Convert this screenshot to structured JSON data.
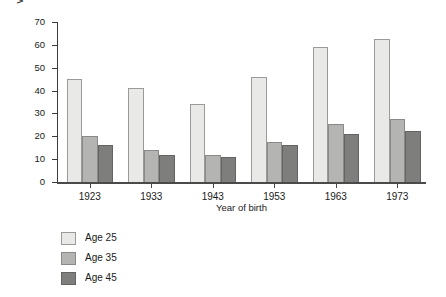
{
  "chart_data": {
    "type": "bar",
    "title": "",
    "subtitle": "",
    "xlabel": "Year of birth",
    "ylabel": "Women childless (%)",
    "categories": [
      "1923",
      "1933",
      "1943",
      "1953",
      "1963",
      "1973"
    ],
    "series": [
      {
        "name": "Age 25",
        "color": "#e9e9e7",
        "values": [
          45,
          41,
          34,
          46,
          59,
          62.5
        ]
      },
      {
        "name": "Age 35",
        "color": "#b4b4b2",
        "values": [
          20,
          14,
          12,
          17.5,
          25.5,
          27.5
        ]
      },
      {
        "name": "Age 45",
        "color": "#7e7e7c",
        "values": [
          16,
          12,
          11,
          16,
          21,
          22.5
        ]
      }
    ],
    "ylim": [
      0,
      70
    ],
    "yticks": [
      0,
      10,
      20,
      30,
      40,
      50,
      60,
      70
    ],
    "ytick_labels": [
      "0",
      "10",
      "20",
      "30",
      "40",
      "50",
      "60",
      "70"
    ],
    "grid": false,
    "legend_position": "below-left",
    "annotations": []
  },
  "legend": {
    "entries": [
      {
        "label": "Age 25"
      },
      {
        "label": "Age 35"
      },
      {
        "label": "Age 45"
      }
    ]
  }
}
